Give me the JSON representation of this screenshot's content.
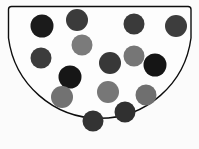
{
  "image": {
    "title": "Bowl containing colored balls",
    "width": 199,
    "height": 149,
    "background_color": "#fbfbfb"
  },
  "container": {
    "name": "bowl",
    "shape": "semicircular-bowl",
    "fill_color": "#fdfdfd",
    "stroke_color": "#0d0d0d",
    "stroke_width": 1.4,
    "rim_left_x": 8,
    "rim_right_x": 191,
    "rim_y": 6,
    "bottom_y": 132,
    "path": "M 8.5 9.5 Q 8.5 6.5 11.5 6.5 L 188 6.5 Q 191 6.5 191 9.5 L 191 38 A 92 92 0 0 1 8.5 38 Z"
  },
  "legend": {
    "shades": [
      {
        "key": "black",
        "label": "black ball",
        "color": "#1b1b1b"
      },
      {
        "key": "dark-gray",
        "label": "dark gray ball",
        "color": "#3f3f3f"
      },
      {
        "key": "medium-gray",
        "label": "medium gray ball",
        "color": "#7d7d7d"
      }
    ]
  },
  "balls": [
    {
      "id": 1,
      "name": "ball-1",
      "cx": 42,
      "cy": 26,
      "r": 11.5,
      "shade": "black",
      "color": "#1b1b1b"
    },
    {
      "id": 2,
      "name": "ball-2",
      "cx": 77,
      "cy": 20,
      "r": 11.0,
      "shade": "dark-gray",
      "color": "#3b3b3b"
    },
    {
      "id": 3,
      "name": "ball-3",
      "cx": 134,
      "cy": 24,
      "r": 10.5,
      "shade": "dark-gray",
      "color": "#3a3a3a"
    },
    {
      "id": 4,
      "name": "ball-4",
      "cx": 176,
      "cy": 26,
      "r": 11.0,
      "shade": "dark-gray",
      "color": "#3d3d3d"
    },
    {
      "id": 5,
      "name": "ball-5",
      "cx": 82,
      "cy": 45,
      "r": 10.5,
      "shade": "medium-gray",
      "color": "#7b7b7b"
    },
    {
      "id": 6,
      "name": "ball-6",
      "cx": 41,
      "cy": 58,
      "r": 10.5,
      "shade": "dark-gray",
      "color": "#3c3c3c"
    },
    {
      "id": 7,
      "name": "ball-7",
      "cx": 134,
      "cy": 56,
      "r": 10.5,
      "shade": "medium-gray",
      "color": "#767676"
    },
    {
      "id": 8,
      "name": "ball-8",
      "cx": 110,
      "cy": 63,
      "r": 11.0,
      "shade": "dark-gray",
      "color": "#383838"
    },
    {
      "id": 9,
      "name": "ball-9",
      "cx": 155,
      "cy": 65,
      "r": 11.5,
      "shade": "black",
      "color": "#151515"
    },
    {
      "id": 10,
      "name": "ball-10",
      "cx": 70,
      "cy": 77,
      "r": 11.5,
      "shade": "black",
      "color": "#161616"
    },
    {
      "id": 11,
      "name": "ball-11",
      "cx": 62,
      "cy": 97,
      "r": 11.0,
      "shade": "medium-gray",
      "color": "#727272"
    },
    {
      "id": 12,
      "name": "ball-12",
      "cx": 108,
      "cy": 92,
      "r": 11.0,
      "shade": "medium-gray",
      "color": "#777777"
    },
    {
      "id": 13,
      "name": "ball-13",
      "cx": 146,
      "cy": 95,
      "r": 10.5,
      "shade": "medium-gray",
      "color": "#6f6f6f"
    },
    {
      "id": 14,
      "name": "ball-14",
      "cx": 125,
      "cy": 112,
      "r": 10.5,
      "shade": "dark-gray",
      "color": "#303030"
    },
    {
      "id": 15,
      "name": "ball-15",
      "cx": 93,
      "cy": 121,
      "r": 10.5,
      "shade": "dark-gray",
      "color": "#333333"
    }
  ],
  "counts": {
    "total": 15,
    "black": 3,
    "dark_gray": 7,
    "medium_gray": 5
  }
}
